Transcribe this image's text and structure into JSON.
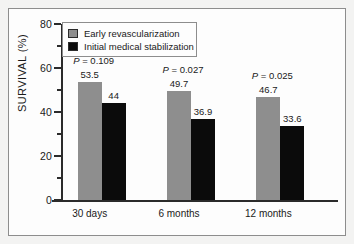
{
  "chart_data": {
    "type": "bar",
    "title": "",
    "xlabel": "",
    "ylabel": "SURVIVAL (%)",
    "ylim": [
      0,
      80
    ],
    "yticks": [
      0,
      20,
      40,
      60,
      80
    ],
    "yticks_minor": [
      10,
      30,
      50,
      70
    ],
    "grid": false,
    "legend_position": "top-left",
    "categories": [
      "30 days",
      "6 months",
      "12 months"
    ],
    "series": [
      {
        "name": "Early revascularization",
        "color": "#8e8e8e",
        "values": [
          53.5,
          49.7,
          46.7
        ],
        "labels": [
          "53.5",
          "49.7",
          "46.7"
        ]
      },
      {
        "name": "Initial medical stabilization",
        "color": "#0b0b0b",
        "values": [
          44,
          36.9,
          33.6
        ],
        "labels": [
          "44",
          "36.9",
          "33.6"
        ]
      }
    ],
    "annotations": [
      {
        "category": "30 days",
        "stat_symbol": "P",
        "text": "= 0.109",
        "value": 0.109
      },
      {
        "category": "6 months",
        "stat_symbol": "P",
        "text": "= 0.027",
        "value": 0.027
      },
      {
        "category": "12 months",
        "stat_symbol": "P",
        "text": "= 0.025",
        "value": 0.025
      }
    ]
  },
  "legend": {
    "entries": [
      {
        "label": "Early revascularization"
      },
      {
        "label": "Initial medical stabilization"
      }
    ]
  }
}
